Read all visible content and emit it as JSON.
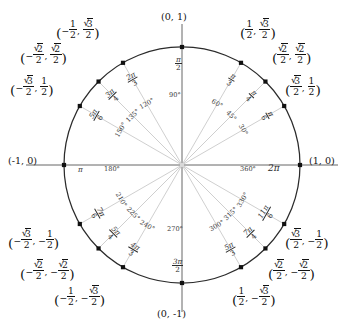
{
  "figure": {
    "title": "Unit circle with radian measures, degree measures and coordinates",
    "type": "unit-circle-diagram",
    "center_px": [
      182,
      165
    ],
    "radius_px": 118,
    "colors": {
      "circle_stroke": "#2b2b2b",
      "axis_stroke": "#555555",
      "spoke_stroke": "#c9c9c9",
      "point_fill": "#111111",
      "background": "#ffffff",
      "text": "#111111"
    }
  },
  "axis_labels": {
    "top": "(0, 1)",
    "bottom": "(0, -1)",
    "left": "(-1, 0)",
    "right": "(1, 0)"
  },
  "axis_angle_labels": {
    "right_radian": "2π",
    "right_degree": "360°",
    "left_radian": "π",
    "left_degree": "180°",
    "top_radian_num": "π",
    "top_radian_den": "2",
    "top_degree": "90°",
    "bottom_radian_num": "3π",
    "bottom_radian_den": "2",
    "bottom_degree": "270°"
  },
  "chart_data": {
    "type": "scatter",
    "title": "Unit circle",
    "xlabel": "",
    "ylabel": "",
    "xlim": [
      -1,
      1
    ],
    "ylim": [
      -1,
      1
    ],
    "grid": false,
    "legend": "none",
    "points": [
      {
        "degrees": 0,
        "radian": "2π",
        "radian_num": "2π",
        "radian_den": "",
        "x": 1,
        "y": 0,
        "coord": "(1, 0)"
      },
      {
        "degrees": 30,
        "radian": "π/6",
        "radian_num": "π",
        "radian_den": "6",
        "x": 0.8660254,
        "y": 0.5,
        "coord": "(√3/2, 1/2)"
      },
      {
        "degrees": 45,
        "radian": "π/4",
        "radian_num": "π",
        "radian_den": "4",
        "x": 0.7071068,
        "y": 0.7071068,
        "coord": "(√2/2, √2/2)"
      },
      {
        "degrees": 60,
        "radian": "π/3",
        "radian_num": "π",
        "radian_den": "3",
        "x": 0.5,
        "y": 0.8660254,
        "coord": "(1/2, √3/2)"
      },
      {
        "degrees": 90,
        "radian": "π/2",
        "radian_num": "π",
        "radian_den": "2",
        "x": 0,
        "y": 1,
        "coord": "(0, 1)"
      },
      {
        "degrees": 120,
        "radian": "2π/3",
        "radian_num": "2π",
        "radian_den": "3",
        "x": -0.5,
        "y": 0.8660254,
        "coord": "(-1/2, √3/2)"
      },
      {
        "degrees": 135,
        "radian": "3π/4",
        "radian_num": "3π",
        "radian_den": "4",
        "x": -0.7071068,
        "y": 0.7071068,
        "coord": "(-√2/2, √2/2)"
      },
      {
        "degrees": 150,
        "radian": "5π/6",
        "radian_num": "5π",
        "radian_den": "6",
        "x": -0.8660254,
        "y": 0.5,
        "coord": "(-√3/2, 1/2)"
      },
      {
        "degrees": 180,
        "radian": "π",
        "radian_num": "π",
        "radian_den": "",
        "x": -1,
        "y": 0,
        "coord": "(-1, 0)"
      },
      {
        "degrees": 210,
        "radian": "7π/6",
        "radian_num": "7π",
        "radian_den": "6",
        "x": -0.8660254,
        "y": -0.5,
        "coord": "(-√3/2, -1/2)"
      },
      {
        "degrees": 225,
        "radian": "5π/4",
        "radian_num": "5π",
        "radian_den": "4",
        "x": -0.7071068,
        "y": -0.7071068,
        "coord": "(-√2/2, -√2/2)"
      },
      {
        "degrees": 240,
        "radian": "4π/3",
        "radian_num": "4π",
        "radian_den": "3",
        "x": -0.5,
        "y": -0.8660254,
        "coord": "(-1/2, -√3/2)"
      },
      {
        "degrees": 270,
        "radian": "3π/2",
        "radian_num": "3π",
        "radian_den": "2",
        "x": 0,
        "y": -1,
        "coord": "(0, -1)"
      },
      {
        "degrees": 300,
        "radian": "5π/3",
        "radian_num": "5π",
        "radian_den": "3",
        "x": 0.5,
        "y": -0.8660254,
        "coord": "(1/2, -√3/2)"
      },
      {
        "degrees": 315,
        "radian": "7π/4",
        "radian_num": "7π",
        "radian_den": "4",
        "x": 0.7071068,
        "y": -0.7071068,
        "coord": "(√2/2, -√2/2)"
      },
      {
        "degrees": 330,
        "radian": "11π/6",
        "radian_num": "11π",
        "radian_den": "6",
        "x": 0.8660254,
        "y": -0.5,
        "coord": "(√3/2, -1/2)"
      }
    ]
  },
  "degree_labels": [
    "30°",
    "45°",
    "60°",
    "90°",
    "120°",
    "135°",
    "150°",
    "180°",
    "210°",
    "225°",
    "240°",
    "270°",
    "300°",
    "315°",
    "330°",
    "360°"
  ]
}
